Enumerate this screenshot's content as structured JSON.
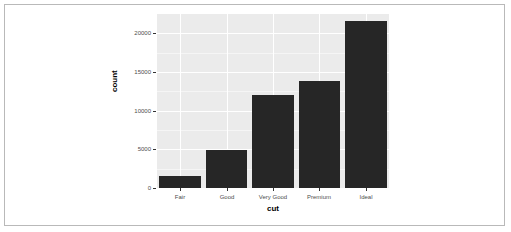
{
  "figure": {
    "border_color": "#b9b9b9",
    "background": "#ffffff"
  },
  "chart_data": {
    "type": "bar",
    "title": "",
    "subtitle": "",
    "xlabel": "cut",
    "ylabel": "count",
    "categories": [
      "Fair",
      "Good",
      "Very Good",
      "Premium",
      "Ideal"
    ],
    "values": [
      1610,
      4906,
      12082,
      13791,
      21551
    ],
    "series": [
      {
        "name": "count",
        "values": [
          1610,
          4906,
          12082,
          13791,
          21551
        ]
      }
    ],
    "ylim": [
      0,
      22500
    ],
    "ytick_values": [
      0,
      5000,
      10000,
      15000,
      20000
    ],
    "ytick_labels": [
      "0",
      "5000",
      "10000",
      "15000",
      "20000"
    ],
    "yminor_values": [
      2500,
      7500,
      12500,
      17500
    ],
    "grid": true,
    "legend": "none",
    "bar_color": "#262626",
    "panel_background": "#ebebeb",
    "major_grid_color": "#ffffff",
    "minor_grid_color": "#f5f5f5",
    "axis_text_color": "#4d4d4d",
    "axis_title_color": "#000000"
  }
}
